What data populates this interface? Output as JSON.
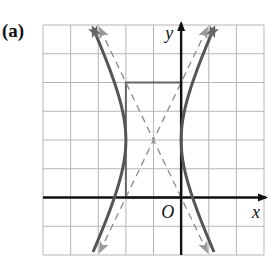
{
  "panel_label": "(a)",
  "chart_data": {
    "type": "line",
    "title": "",
    "panel": "(a)",
    "xlabel": "x",
    "ylabel": "y",
    "origin_label": "O",
    "xlim": [
      -5,
      3
    ],
    "ylim": [
      -2,
      6
    ],
    "grid": true,
    "grid_step": 1,
    "series": [
      {
        "name": "hyperbola",
        "equation": "(x+1)^2 - (y-2)^2/4 = 1",
        "center": [
          -1,
          2
        ],
        "a": 1,
        "b": 2,
        "orientation": "horizontal",
        "vertices": [
          [
            -2,
            2
          ],
          [
            0,
            2
          ]
        ],
        "color": "#555555",
        "style": "solid"
      },
      {
        "name": "asymptote-1",
        "equation": "y - 2 = 2(x + 1)",
        "color": "#777777",
        "style": "dashed"
      },
      {
        "name": "asymptote-2",
        "equation": "y - 2 = -2(x + 1)",
        "color": "#777777",
        "style": "dashed"
      },
      {
        "name": "fundamental-rectangle",
        "corners": [
          [
            -2,
            0
          ],
          [
            0,
            0
          ],
          [
            0,
            4
          ],
          [
            -2,
            4
          ]
        ],
        "color": "#666666",
        "style": "solid"
      }
    ]
  }
}
